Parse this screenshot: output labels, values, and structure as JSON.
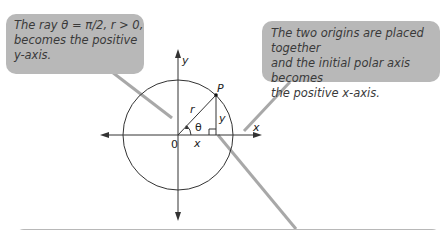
{
  "callouts": [
    {
      "id": "top-left",
      "text_lines": [
        "The ray θ = π/2, r > 0,",
        "becomes the positive",
        "y-axis."
      ]
    },
    {
      "id": "top-right",
      "text_lines": [
        "The two origins are placed together",
        "and the initial polar axis becomes",
        "the positive x-axis."
      ]
    },
    {
      "id": "bottom",
      "text_lines": []
    }
  ],
  "diagram": {
    "labels": {
      "y_axis": "y",
      "x_axis": "x",
      "origin": "0",
      "point": "P",
      "radius": "r",
      "angle": "θ",
      "x_leg": "x",
      "y_leg": "y"
    },
    "colors": {
      "callout_fill": "#b8b8b8",
      "leader_line": "#a8a8a8",
      "line": "#333333"
    }
  }
}
